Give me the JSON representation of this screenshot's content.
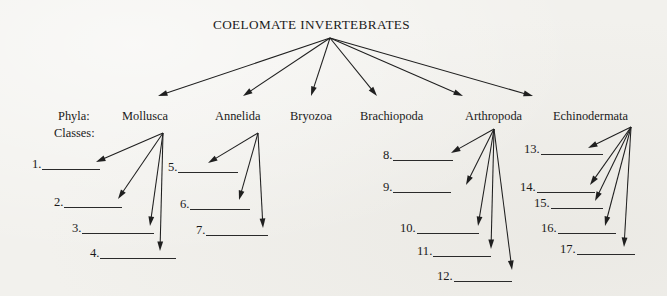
{
  "title": "COELOMATE INVERTEBRATES",
  "row_labels": {
    "phyla": "Phyla:",
    "classes": "Classes:"
  },
  "phyla": [
    {
      "name": "Mollusca",
      "x": 122,
      "y": 110
    },
    {
      "name": "Annelida",
      "x": 215,
      "y": 110
    },
    {
      "name": "Bryozoa",
      "x": 290,
      "y": 110
    },
    {
      "name": "Brachiopoda",
      "x": 360,
      "y": 110
    },
    {
      "name": "Arthropoda",
      "x": 465,
      "y": 110
    },
    {
      "name": "Echinodermata",
      "x": 553,
      "y": 110
    }
  ],
  "blanks": [
    {
      "label": "1.",
      "x": 32,
      "y": 158,
      "width": 58
    },
    {
      "label": "2.",
      "x": 54,
      "y": 196,
      "width": 58
    },
    {
      "label": "3.",
      "x": 72,
      "y": 222,
      "width": 72
    },
    {
      "label": "4.",
      "x": 90,
      "y": 247,
      "width": 76
    },
    {
      "label": "5.",
      "x": 168,
      "y": 161,
      "width": 60
    },
    {
      "label": "6.",
      "x": 180,
      "y": 198,
      "width": 60
    },
    {
      "label": "7.",
      "x": 196,
      "y": 224,
      "width": 62
    },
    {
      "label": "8.",
      "x": 383,
      "y": 149,
      "width": 60
    },
    {
      "label": "9.",
      "x": 383,
      "y": 181,
      "width": 58
    },
    {
      "label": "10.",
      "x": 400,
      "y": 222,
      "width": 62
    },
    {
      "label": "11.",
      "x": 417,
      "y": 245,
      "width": 58
    },
    {
      "label": "12.",
      "x": 437,
      "y": 270,
      "width": 58
    },
    {
      "label": "13.",
      "x": 524,
      "y": 143,
      "width": 62
    },
    {
      "label": "14.",
      "x": 520,
      "y": 181,
      "width": 58
    },
    {
      "label": "15.",
      "x": 534,
      "y": 197,
      "width": 52
    },
    {
      "label": "16.",
      "x": 541,
      "y": 222,
      "width": 58
    },
    {
      "label": "17.",
      "x": 560,
      "y": 243,
      "width": 58
    }
  ],
  "arrows": {
    "root": {
      "x": 330,
      "y": 38
    },
    "trunk": [
      {
        "x2": 158,
        "y2": 96
      },
      {
        "x2": 243,
        "y2": 96
      },
      {
        "x2": 311,
        "y2": 96
      },
      {
        "x2": 377,
        "y2": 96
      },
      {
        "x2": 463,
        "y2": 96
      },
      {
        "x2": 533,
        "y2": 96
      }
    ],
    "groups": [
      {
        "phylum": "Mollusca",
        "origin": {
          "x": 163,
          "y": 133
        },
        "targets": [
          {
            "x": 96,
            "y": 162
          },
          {
            "x": 118,
            "y": 199
          },
          {
            "x": 150,
            "y": 226
          },
          {
            "x": 160,
            "y": 251
          }
        ]
      },
      {
        "phylum": "Annelida",
        "origin": {
          "x": 258,
          "y": 133
        },
        "targets": [
          {
            "x": 208,
            "y": 163
          },
          {
            "x": 239,
            "y": 200
          },
          {
            "x": 263,
            "y": 228
          }
        ]
      },
      {
        "phylum": "Arthropoda",
        "origin": {
          "x": 494,
          "y": 129
        },
        "targets": [
          {
            "x": 451,
            "y": 153
          },
          {
            "x": 466,
            "y": 185
          },
          {
            "x": 478,
            "y": 226
          },
          {
            "x": 491,
            "y": 249
          },
          {
            "x": 512,
            "y": 270
          }
        ]
      },
      {
        "phylum": "Echinodermata",
        "origin": {
          "x": 631,
          "y": 127
        },
        "targets": [
          {
            "x": 588,
            "y": 148
          },
          {
            "x": 590,
            "y": 185
          },
          {
            "x": 595,
            "y": 201
          },
          {
            "x": 605,
            "y": 226
          },
          {
            "x": 624,
            "y": 247
          }
        ]
      }
    ]
  },
  "colors": {
    "ink": "#1f1f1f",
    "paper": "#f2f1ed",
    "rule": "#2a2a2a"
  }
}
